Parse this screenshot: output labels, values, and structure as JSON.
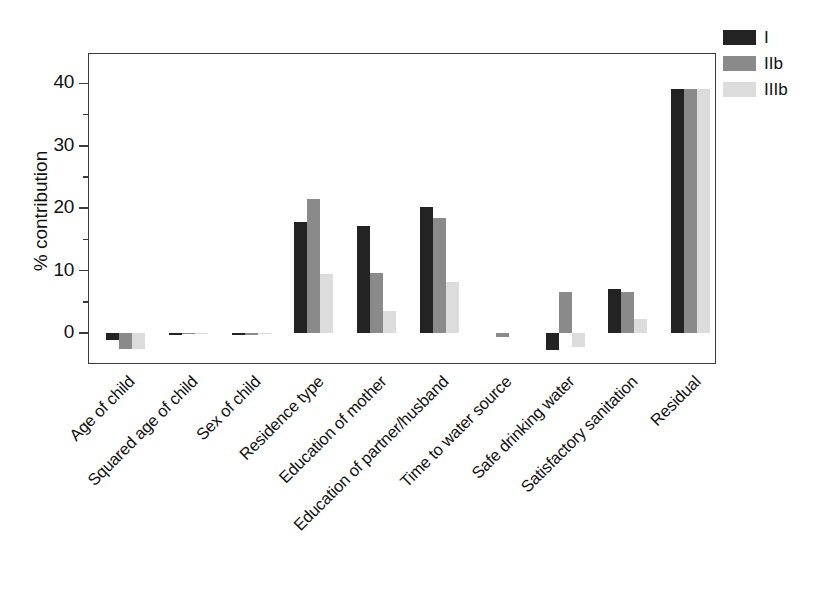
{
  "chart_data": {
    "type": "bar",
    "title": "",
    "xlabel": "",
    "ylabel": "% contribution",
    "ylim": [
      -5,
      45
    ],
    "yticks": [
      0,
      10,
      20,
      30,
      40
    ],
    "ytick_labels": [
      "0",
      "10",
      "20",
      "30",
      "40"
    ],
    "yminor_ticks": [
      5,
      15,
      25,
      35
    ],
    "grid": false,
    "legend_position": "top-right",
    "categories": [
      "Age of child",
      "Squared age of child",
      "Sex of child",
      "Residence type",
      "Education of mother",
      "Education of partner/husband",
      "Time to water source",
      "Safe drinking water",
      "Satisfactory sanitation",
      "Residual"
    ],
    "series": [
      {
        "name": "I",
        "color": "#232323",
        "values": [
          -1.2,
          -0.3,
          -0.4,
          17.8,
          17.2,
          20.2,
          0.0,
          -2.8,
          7.0,
          39.1
        ]
      },
      {
        "name": "IIb",
        "color": "#8a8a8a",
        "values": [
          -2.6,
          -0.2,
          -0.3,
          21.4,
          9.6,
          18.4,
          -0.7,
          6.5,
          6.5,
          39.1
        ]
      },
      {
        "name": "IIIb",
        "color": "#dcdcdc",
        "values": [
          -2.6,
          -0.1,
          -0.1,
          9.4,
          3.6,
          8.2,
          0.0,
          -2.2,
          2.2,
          39.1
        ]
      }
    ]
  },
  "legend": {
    "entries": [
      {
        "label": "I",
        "swatch": "dark-swatch"
      },
      {
        "label": "IIb",
        "swatch": "medium-gray-swatch"
      },
      {
        "label": "IIIb",
        "swatch": "light-gray-swatch"
      }
    ]
  },
  "caption": {
    "text": ""
  }
}
